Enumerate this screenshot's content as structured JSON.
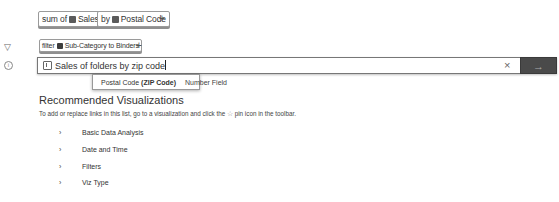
{
  "shelf": {
    "measure": {
      "prefix": "sum of",
      "field": "Sales"
    },
    "dimension": {
      "prefix": "by",
      "field": "Postal Code"
    },
    "add_label": "+"
  },
  "filter_row": {
    "icon": "filter-icon",
    "pill": {
      "prefix": "filter",
      "field": "Sub-Category",
      "suffix": "to Binders"
    },
    "add_label": "+"
  },
  "search": {
    "info_icon": "info-icon",
    "value": "Sales of folders by zip code",
    "clear_label": "×",
    "go_label": "→"
  },
  "suggestion": {
    "name": "Postal Code",
    "alias": "(ZIP Code)",
    "type": "Number Field"
  },
  "recommendations": {
    "title": "Recommended Visualizations",
    "subtitle_before": "To add or replace links in this list, go to a visualization and click the",
    "pin_glyph": "☆",
    "subtitle_after": "pin icon in the toolbar.",
    "categories": [
      {
        "label": "Basic Data Analysis"
      },
      {
        "label": "Date and Time"
      },
      {
        "label": "Filters"
      },
      {
        "label": "Viz Type"
      }
    ],
    "chevron": "›"
  }
}
